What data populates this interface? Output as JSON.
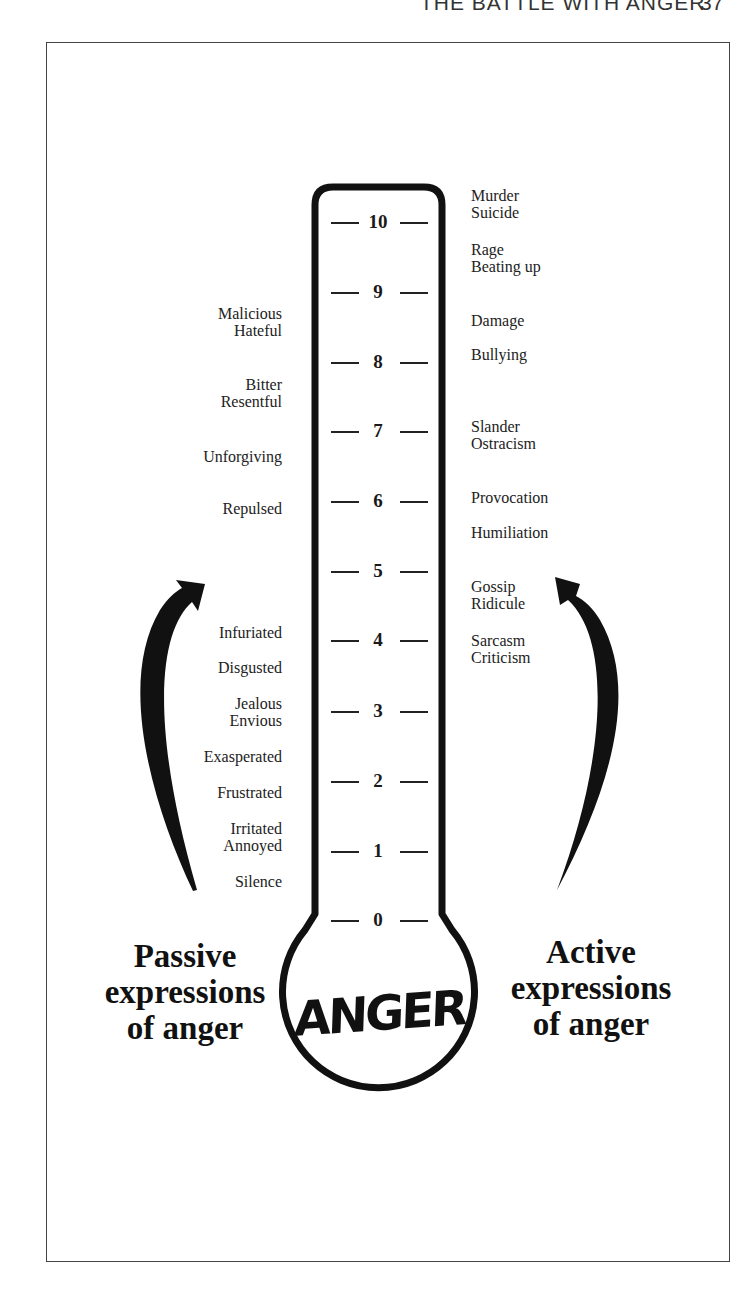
{
  "header": {
    "running_title": "THE BATTLE WITH ANGER",
    "page_number": "37"
  },
  "thermometer": {
    "bulb_label": "ANGER",
    "scale": [
      {
        "value": "10",
        "y": 222
      },
      {
        "value": "9",
        "y": 292
      },
      {
        "value": "8",
        "y": 362
      },
      {
        "value": "7",
        "y": 431
      },
      {
        "value": "6",
        "y": 501
      },
      {
        "value": "5",
        "y": 571
      },
      {
        "value": "4",
        "y": 640
      },
      {
        "value": "3",
        "y": 711
      },
      {
        "value": "2",
        "y": 781
      },
      {
        "value": "1",
        "y": 851
      },
      {
        "value": "0",
        "y": 920
      }
    ]
  },
  "passive": {
    "caption_line1": "Passive",
    "caption_line2": "expressions",
    "caption_line3": "of anger",
    "items": [
      {
        "line1": "Malicious",
        "line2": "Hateful"
      },
      {
        "line1": "Bitter",
        "line2": "Resentful"
      },
      {
        "line1": "Unforgiving"
      },
      {
        "line1": "Repulsed"
      },
      {
        "line1": "Infuriated"
      },
      {
        "line1": "Disgusted"
      },
      {
        "line1": "Jealous",
        "line2": "Envious"
      },
      {
        "line1": "Exasperated"
      },
      {
        "line1": "Frustrated"
      },
      {
        "line1": "Irritated",
        "line2": "Annoyed"
      },
      {
        "line1": "Silence"
      }
    ]
  },
  "active": {
    "caption_line1": "Active",
    "caption_line2": "expressions",
    "caption_line3": "of anger",
    "items": [
      {
        "line1": "Murder",
        "line2": "Suicide"
      },
      {
        "line1": "Rage",
        "line2": "Beating up"
      },
      {
        "line1": "Damage"
      },
      {
        "line1": "Bullying"
      },
      {
        "line1": "Slander",
        "line2": "Ostracism"
      },
      {
        "line1": "Provocation"
      },
      {
        "line1": "Humiliation"
      },
      {
        "line1": "Gossip",
        "line2": "Ridicule"
      },
      {
        "line1": "Sarcasm",
        "line2": "Criticism"
      }
    ]
  }
}
